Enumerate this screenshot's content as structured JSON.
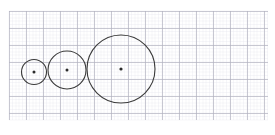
{
  "figure": {
    "background_color": "#ffffff",
    "width": 275,
    "height": 135
  },
  "grid": {
    "label": "graph-paper-grid",
    "x_start": 9,
    "y_start": 11,
    "x_end": 268,
    "y_end": 120,
    "major_spacing": 17,
    "minor_spacing": 3.4,
    "major_color": "#b2b2c0",
    "minor_color": "#e9e9f1",
    "major_width": 0.7,
    "minor_width": 0.4
  },
  "chart_data": {
    "type": "scatter",
    "xlabel": "",
    "ylabel": "",
    "xlim": [
      9,
      268
    ],
    "ylim": [
      11,
      120
    ],
    "grid": true,
    "legend": "none",
    "series": [
      {
        "name": "circles",
        "shapes": [
          {
            "name": "small-circle",
            "cx": 34,
            "cy": 72,
            "r": 12.5,
            "stroke": "#3a3a3a",
            "stroke_width": 1.1,
            "fill": "none"
          },
          {
            "name": "medium-circle",
            "cx": 67,
            "cy": 70,
            "r": 19,
            "stroke": "#3a3a3a",
            "stroke_width": 1.1,
            "fill": "none"
          },
          {
            "name": "large-circle",
            "cx": 121,
            "cy": 69,
            "r": 34,
            "stroke": "#3a3a3a",
            "stroke_width": 1.1,
            "fill": "none"
          }
        ]
      },
      {
        "name": "centers",
        "points": [
          {
            "name": "small-circle-center",
            "cx": 34,
            "cy": 72,
            "r": 1.5,
            "fill": "#2b2b2b"
          },
          {
            "name": "medium-circle-center",
            "cx": 67,
            "cy": 70,
            "r": 1.5,
            "fill": "#2b2b2b"
          },
          {
            "name": "large-circle-center",
            "cx": 121,
            "cy": 69,
            "r": 1.6,
            "fill": "#2b2b2b"
          }
        ]
      }
    ]
  }
}
